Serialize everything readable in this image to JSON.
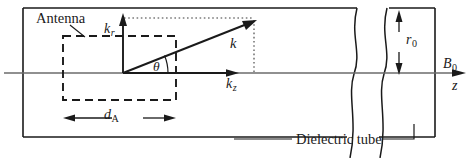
{
  "figure": {
    "background_color": "#ffffff",
    "line_color": "#1a1a1a",
    "axis_color": "#555555",
    "width": 476,
    "height": 158
  },
  "labels": {
    "antenna": "Antenna",
    "k_radial_main": "k",
    "k_radial_sub": "r",
    "k_vector": "k",
    "theta": "θ",
    "k_axial_main": "k",
    "k_axial_sub": "z",
    "antenna_length_main": "d",
    "antenna_length_sub": "A",
    "tube_radius_main": "r",
    "tube_radius_sub": "0",
    "magnetic_field_main": "B",
    "magnetic_field_sub": "0",
    "axis_z": "z",
    "dielectric_tube": "Dielectric tube"
  },
  "geometry": {
    "tube": {
      "left_wall_x": 23,
      "right_wall_x": 435,
      "top_y": 8,
      "bottom_y": 137
    },
    "axis": {
      "y": 73,
      "x_start": 4,
      "x_end": 466
    },
    "origin": {
      "x": 123,
      "y": 73
    },
    "k_vector_tip": {
      "x": 256,
      "y": 22
    },
    "k_radial_axis_tip": {
      "x": 123,
      "y": 17
    },
    "k_axial_axis_tip": {
      "x": 239,
      "y": 73
    },
    "antenna_box": {
      "x1": 63,
      "y1": 36,
      "x2": 176,
      "y2": 100
    },
    "dimension_dA": {
      "y": 118,
      "x1": 63,
      "x2": 176
    },
    "dimension_r0": {
      "x": 399,
      "y_top": 14,
      "y_bottom": 73
    },
    "break_lines_x": [
      352,
      382
    ]
  },
  "annotations": {
    "theta_value_note": "angle between k and k_z axis",
    "leader_antenna": {
      "from_x": 72,
      "from_y": 26,
      "to_x": 85,
      "to_y": 37
    },
    "leader_dielectric": {
      "left_x": 234,
      "right_x": 415,
      "y": 139
    }
  }
}
